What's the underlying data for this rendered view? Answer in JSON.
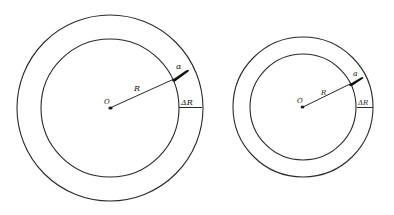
{
  "diagram": {
    "type": "concentric-circles-comparison",
    "stroke_color": "#2a2a2a",
    "background": "#ffffff",
    "figures": [
      {
        "name": "large",
        "center": {
          "x": 110,
          "y": 108
        },
        "inner_radius": 69,
        "outer_radius": 93,
        "labels": {
          "center": "O",
          "radius": "R",
          "particle": "α",
          "thickness": "ΔR"
        }
      },
      {
        "name": "small",
        "center": {
          "x": 303,
          "y": 107
        },
        "inner_radius": 53,
        "outer_radius": 70,
        "labels": {
          "center": "O",
          "radius": "R",
          "particle": "α",
          "thickness": "ΔR"
        }
      }
    ]
  }
}
